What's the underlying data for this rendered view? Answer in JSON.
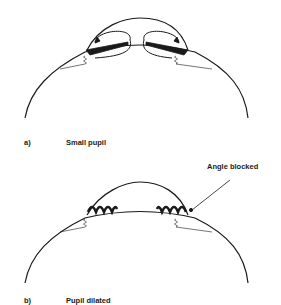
{
  "panels": [
    {
      "letter": "a)",
      "caption": "Small pupil"
    },
    {
      "letter": "b)",
      "caption": "Pupil dilated"
    }
  ],
  "annotations": {
    "angle_blocked": "Angle blocked"
  },
  "colors": {
    "line": "#1a1a1a",
    "background": "#ffffff"
  }
}
